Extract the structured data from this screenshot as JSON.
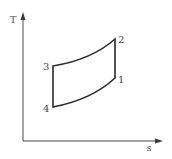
{
  "diagram": {
    "axes": {
      "origin": [
        23,
        141
      ],
      "y_axis": {
        "label": "T",
        "top": [
          23,
          12
        ],
        "label_pos": [
          13,
          23
        ]
      },
      "x_axis": {
        "label": "s",
        "right": [
          163,
          141
        ],
        "label_pos": [
          149,
          151
        ]
      }
    },
    "points": [
      {
        "id": "1",
        "label": "1",
        "x": 115,
        "y": 78,
        "label_pos": [
          118,
          83
        ]
      },
      {
        "id": "2",
        "label": "2",
        "x": 115,
        "y": 39,
        "label_pos": [
          118,
          43
        ]
      },
      {
        "id": "3",
        "label": "3",
        "x": 53,
        "y": 66,
        "label_pos": [
          43,
          70
        ]
      },
      {
        "id": "4",
        "label": "4",
        "x": 53,
        "y": 107,
        "label_pos": [
          43,
          112
        ]
      }
    ],
    "processes": [
      {
        "from": "1",
        "to": "2",
        "type": "vertical line (isentropic)"
      },
      {
        "from": "2",
        "to": "3",
        "type": "curve"
      },
      {
        "from": "3",
        "to": "4",
        "type": "vertical line (isentropic)"
      },
      {
        "from": "4",
        "to": "1",
        "type": "curve"
      }
    ],
    "colors": {
      "background": "#ffffff",
      "axis": "#4a4a4a",
      "cycle": "#2a2a2a",
      "text": "#444444"
    }
  }
}
